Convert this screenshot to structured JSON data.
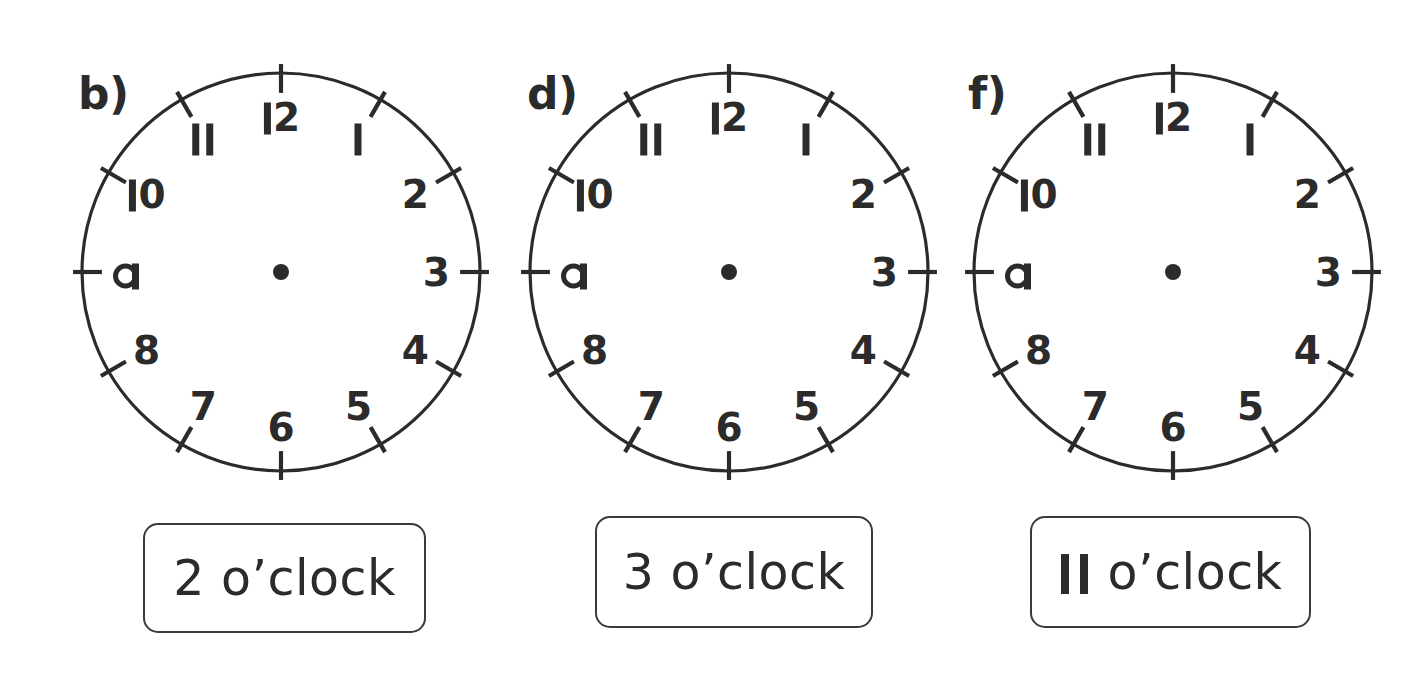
{
  "page": {
    "background": "#ffffff",
    "ink": "#2b2b2b",
    "width": 1428,
    "height": 678
  },
  "numeral_style": {
    "one_is_bare_stroke": true,
    "nine_is_single_storey_q": true
  },
  "clock_face": {
    "radius": 199,
    "numeral_radius_ratio": 0.78,
    "tick_outer_ratio": 1.045,
    "tick_inner_ratio": 0.9,
    "hub_radius": 8,
    "hands_shown": false,
    "hour_labels": [
      "1",
      "2",
      "3",
      "4",
      "5",
      "6",
      "7",
      "8",
      "9",
      "10",
      "11",
      "12"
    ]
  },
  "clocks": [
    {
      "letter": "b)",
      "letter_x": 78,
      "letter_y": 72,
      "center_x": 281,
      "center_y": 272,
      "answer": "2 o’clock",
      "answer_number": "2",
      "box_x": 143,
      "box_y": 523,
      "box_w": 283,
      "box_h": 110
    },
    {
      "letter": "d)",
      "letter_x": 527,
      "letter_y": 72,
      "center_x": 729,
      "center_y": 272,
      "answer": "3 o’clock",
      "answer_number": "3",
      "box_x": 595,
      "box_y": 516,
      "box_w": 278,
      "box_h": 112
    },
    {
      "letter": "f)",
      "letter_x": 968,
      "letter_y": 72,
      "center_x": 1173,
      "center_y": 272,
      "answer": "11 o’clock",
      "answer_number": "11",
      "box_x": 1030,
      "box_y": 516,
      "box_w": 281,
      "box_h": 112
    }
  ],
  "answer_suffix": " o’clock"
}
